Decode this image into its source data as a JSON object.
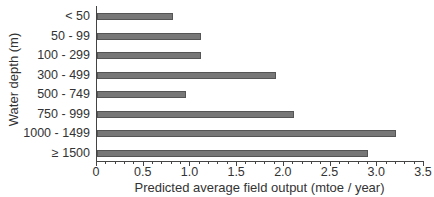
{
  "chart_data": {
    "type": "bar",
    "orientation": "horizontal",
    "title": "",
    "xlabel": "Predicted average field output (mtoe / year)",
    "ylabel": "Water depth (m)",
    "categories": [
      "< 50",
      "50 - 99",
      "100 - 299",
      "300 - 499",
      "500 - 749",
      "750 - 999",
      "1000 - 1499",
      "≥ 1500"
    ],
    "values": [
      0.81,
      1.11,
      1.11,
      1.92,
      0.95,
      2.11,
      3.2,
      2.9
    ],
    "xlim": [
      0,
      3.5
    ],
    "xticks": [
      "0",
      "0.5",
      "1.0",
      "1.5",
      "2.0",
      "2.5",
      "3.0",
      "3.5"
    ],
    "grid": false,
    "legend": null,
    "bar_color": "#777777"
  }
}
